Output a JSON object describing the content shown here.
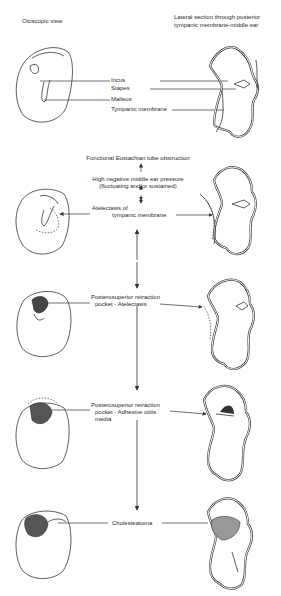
{
  "headers": {
    "left": "Otoscopic view",
    "right_line1": "Lateral section through posterior",
    "right_line2": "tympanic membrane-middle ear"
  },
  "anatomy_labels": {
    "incus": "Incus",
    "stapes": "Stapes",
    "malleus": "Malleus",
    "tympanic_membrane": "Tympanic membrane"
  },
  "flow": {
    "step1": "Functional Eustachian tube obstruction",
    "step2_line1": "High negative middle ear pressure",
    "step2_line2": "(fluctuating and/or sustained)",
    "step3_line1": "Atelectasis of",
    "step3_line2": "tympanic membrane",
    "step4_line1": "Posterosuperior retraction",
    "step4_line2": "pocket - Atelectasis",
    "step5_line1": "Posterosuperior retraction",
    "step5_line2": "pocket - Adhesive otitis",
    "step5_line3": "media",
    "step6": "Cholesteatoma"
  }
}
